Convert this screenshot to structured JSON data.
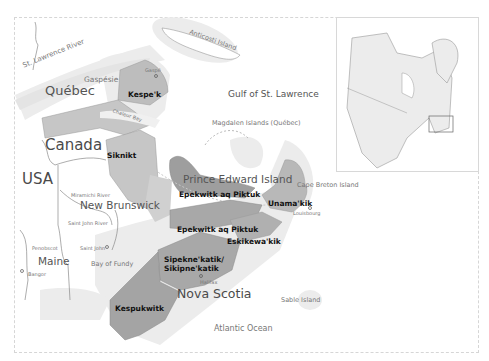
{
  "map": {
    "title": "Mi'kma'ki districts in Atlantic Canada",
    "colors": {
      "background": "#ffffff",
      "land": "#ffffff",
      "district_fill": "#c8c8c8",
      "district_dark": "#9e9e9e",
      "water_halo": "#ececec",
      "border": "#888888"
    },
    "countries": {
      "canada": "Canada",
      "usa": "USA"
    },
    "provinces": {
      "quebec": "Québec",
      "new_brunswick": "New Brunswick",
      "pei": "Prince Edward Island",
      "nova_scotia": "Nova Scotia",
      "maine": "Maine"
    },
    "water": {
      "st_lawrence_river": "St. Lawrence River",
      "gulf": "Gulf of St. Lawrence",
      "chaleur_bay": "Chaleur Bay",
      "bay_of_fundy": "Bay of Fundy",
      "atlantic": "Atlantic Ocean"
    },
    "islands": {
      "anticosti": "Anticosti Island",
      "magdalen": "Magdalen Islands (Québec)",
      "cape_breton": "Cape Breton Island",
      "sable": "Sable Island"
    },
    "regions": {
      "gaspesie": "Gaspésie"
    },
    "rivers": {
      "miramichi": "Miramichi River",
      "saint_john": "Saint John River",
      "penobscot": "Penobscot"
    },
    "towns": {
      "gaspe": "Gaspé",
      "saint_john": "Saint John",
      "bangor": "Bangor",
      "halifax": "Halifax",
      "louisbourg": "Louisbourg"
    },
    "districts": [
      {
        "id": "kespek",
        "label": "Kespe'k"
      },
      {
        "id": "siknikt",
        "label": "Siknikt"
      },
      {
        "id": "epekwitk-pei",
        "label": "Epekwitk aq Piktuk"
      },
      {
        "id": "epekwitk-ns",
        "label": "Epekwitk aq Piktuk"
      },
      {
        "id": "unamakik",
        "label": "Unama'kik"
      },
      {
        "id": "eskikewakik",
        "label": "Eskikewa'kik"
      },
      {
        "id": "sipeknekatik",
        "label": "Sipekne'katik/\nSikipne'katik"
      },
      {
        "id": "kespukwitk",
        "label": "Kespukwitk"
      }
    ],
    "inset": {
      "label": "North America locator"
    }
  }
}
